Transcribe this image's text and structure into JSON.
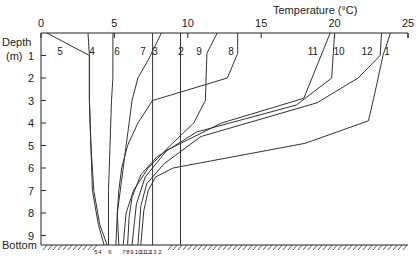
{
  "chart_data": {
    "type": "line",
    "title": "",
    "xlabel": "Temperature (°C)",
    "ylabel": "Depth (m)",
    "ylabel_line1": "Depth",
    "ylabel_line2": "(m)",
    "bottom_label": "Bottom",
    "xlim": [
      0,
      25
    ],
    "ylim": [
      0,
      9.6
    ],
    "x_ticks": [
      0,
      5,
      10,
      15,
      20,
      25
    ],
    "y_ticks": [
      1,
      2,
      3,
      4,
      5,
      6,
      7,
      8,
      9
    ],
    "x_axis_position": "top",
    "grid": false,
    "legend": "inline curve numbers",
    "series": [
      {
        "name": "1",
        "points": [
          [
            23.8,
            0
          ],
          [
            23.3,
            1
          ],
          [
            22.7,
            2.8
          ],
          [
            22.3,
            3.9
          ],
          [
            18,
            4.9
          ],
          [
            9,
            6
          ],
          [
            7.8,
            6.4
          ],
          [
            7.3,
            7
          ],
          [
            7,
            7.9
          ],
          [
            6.8,
            9.6
          ]
        ]
      },
      {
        "name": "2",
        "points": [
          [
            9.5,
            0
          ],
          [
            9.5,
            9.6
          ]
        ]
      },
      {
        "name": "3",
        "points": [
          [
            8.2,
            0
          ],
          [
            7.3,
            1.2
          ],
          [
            6.6,
            2
          ],
          [
            6.2,
            3
          ],
          [
            6,
            4
          ],
          [
            5.8,
            5
          ],
          [
            5.6,
            6
          ],
          [
            5.4,
            7
          ],
          [
            5.2,
            8
          ],
          [
            5.1,
            9.6
          ]
        ]
      },
      {
        "name": "4",
        "points": [
          [
            3.2,
            0
          ],
          [
            3.3,
            1
          ],
          [
            3.3,
            3
          ],
          [
            3.4,
            5
          ],
          [
            3.6,
            7
          ],
          [
            4.0,
            8.5
          ],
          [
            4.5,
            9.6
          ]
        ]
      },
      {
        "name": "5",
        "points": [
          [
            0.4,
            0
          ],
          [
            3.3,
            1
          ],
          [
            3.3,
            3
          ],
          [
            3.4,
            5
          ],
          [
            3.5,
            7
          ],
          [
            3.9,
            8.5
          ],
          [
            4.3,
            9.6
          ]
        ]
      },
      {
        "name": "6",
        "points": [
          [
            4.9,
            0
          ],
          [
            4.9,
            2
          ],
          [
            4.8,
            3
          ],
          [
            4.7,
            5
          ],
          [
            4.6,
            7
          ],
          [
            4.6,
            9.6
          ]
        ]
      },
      {
        "name": "7",
        "points": [
          [
            7.6,
            0
          ],
          [
            7.6,
            9.6
          ]
        ]
      },
      {
        "name": "8",
        "points": [
          [
            13.4,
            0
          ],
          [
            13.4,
            0.9
          ],
          [
            12.7,
            2
          ],
          [
            7.6,
            3
          ],
          [
            6.6,
            4
          ],
          [
            5.9,
            5
          ],
          [
            5.5,
            6
          ],
          [
            5.3,
            7
          ],
          [
            5.2,
            8
          ],
          [
            5.3,
            9.6
          ]
        ]
      },
      {
        "name": "9",
        "points": [
          [
            12.0,
            0
          ],
          [
            11.3,
            0.9
          ],
          [
            11.2,
            3
          ],
          [
            10.4,
            4
          ],
          [
            8.8,
            5
          ],
          [
            7.3,
            6
          ],
          [
            6.3,
            7
          ],
          [
            5.8,
            8
          ],
          [
            5.6,
            9.6
          ]
        ]
      },
      {
        "name": "10",
        "points": [
          [
            20,
            0
          ],
          [
            19.8,
            2
          ],
          [
            17.4,
            3.2
          ],
          [
            10.6,
            4.4
          ],
          [
            7.9,
            5.5
          ],
          [
            6.8,
            6.3
          ],
          [
            6.2,
            7.3
          ],
          [
            6.0,
            8.2
          ],
          [
            5.9,
            9.6
          ]
        ]
      },
      {
        "name": "11",
        "points": [
          [
            19.7,
            0
          ],
          [
            17.9,
            2.9
          ],
          [
            12.3,
            4
          ],
          [
            8.6,
            5.2
          ],
          [
            7.1,
            6.4
          ],
          [
            6.5,
            7.6
          ],
          [
            6.2,
            9.6
          ]
        ]
      },
      {
        "name": "12",
        "points": [
          [
            23.2,
            0
          ],
          [
            23.1,
            1
          ],
          [
            21.6,
            2
          ],
          [
            18.8,
            3.1
          ],
          [
            10.9,
            4.6
          ],
          [
            8.4,
            5.8
          ],
          [
            7.2,
            6.7
          ],
          [
            6.8,
            7.7
          ],
          [
            6.6,
            9.6
          ]
        ]
      }
    ],
    "bottom_order_labels": [
      "5",
      "4",
      "6",
      "7",
      "8",
      "9",
      "10",
      "11",
      "12",
      "1",
      "3",
      "2"
    ]
  },
  "labels": {
    "curve_labels": [
      {
        "text": "5",
        "x": 60,
        "y": 55
      },
      {
        "text": "4",
        "x": 92,
        "y": 55
      },
      {
        "text": "6",
        "x": 117,
        "y": 55
      },
      {
        "text": "7",
        "x": 143,
        "y": 55
      },
      {
        "text": "3",
        "x": 155,
        "y": 55
      },
      {
        "text": "2",
        "x": 181,
        "y": 55
      },
      {
        "text": "9",
        "x": 199,
        "y": 55
      },
      {
        "text": "8",
        "x": 231,
        "y": 55
      },
      {
        "text": "11",
        "x": 313,
        "y": 55
      },
      {
        "text": "10",
        "x": 339,
        "y": 55
      },
      {
        "text": "12",
        "x": 367,
        "y": 55
      },
      {
        "text": "1",
        "x": 387,
        "y": 55
      }
    ],
    "bottom_tags": [
      {
        "text": "5",
        "x": 96
      },
      {
        "text": "4",
        "x": 100
      },
      {
        "text": "6",
        "x": 110
      },
      {
        "text": "7",
        "x": 124
      },
      {
        "text": "8",
        "x": 128
      },
      {
        "text": "9",
        "x": 132
      },
      {
        "text": "10",
        "x": 138
      },
      {
        "text": "11",
        "x": 143
      },
      {
        "text": "12",
        "x": 148
      },
      {
        "text": "1",
        "x": 151
      },
      {
        "text": "3",
        "x": 155
      },
      {
        "text": "2",
        "x": 160
      }
    ]
  }
}
